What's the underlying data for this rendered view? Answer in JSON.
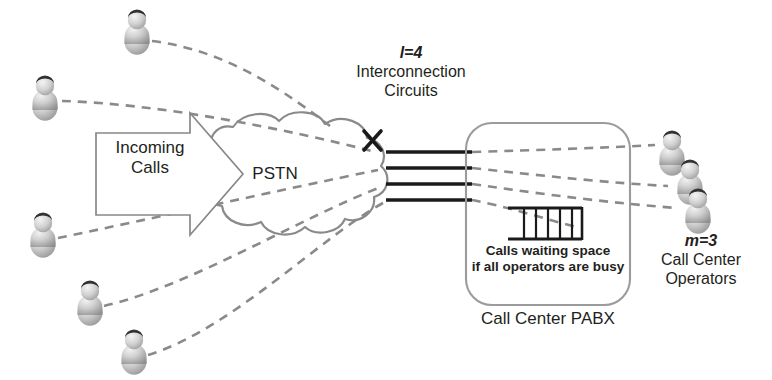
{
  "diagram": {
    "background_color": "#ffffff",
    "line_color": "#808080",
    "text_color": "#231f20",
    "labels": {
      "interconnection_param": "l=4",
      "interconnection_line1": "Interconnection",
      "interconnection_line2": "Circuits",
      "pstn": "PSTN",
      "incoming_line1": "Incoming",
      "incoming_line2": "Calls",
      "waiting_line1": "Calls waiting space",
      "waiting_line2": "if all operators are busy",
      "pabx": "Call Center PABX",
      "operators_param": "m=3",
      "operators_line1": "Call Center",
      "operators_line2": "Operators",
      "blocked_mark": "X"
    },
    "counts": {
      "interconnection_circuits": 4,
      "operators": 3,
      "callers": 5,
      "waiting_slots": 5
    },
    "icons": {
      "caller": "person-icon",
      "operator": "person-icon",
      "blocked": "x-mark-icon",
      "network": "cloud-icon",
      "queue": "queue-icon",
      "flow": "block-arrow-icon"
    }
  }
}
